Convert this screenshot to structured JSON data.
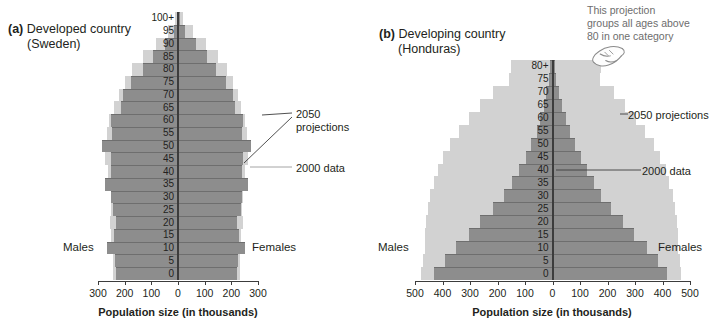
{
  "figure": {
    "x_axis_title": "Population size (in thousands)",
    "males_label": "Males",
    "females_label": "Females",
    "annotation_2050": "2050 projections",
    "annotation_2050_line1": "2050",
    "annotation_2050_line2": "projections",
    "annotation_2000": "2000 data",
    "callout": {
      "line1": "This projection",
      "line2": "groups all ages above",
      "line3": "80 in one category"
    },
    "colors": {
      "projection_2050": "#d2d2d2",
      "data_2000": "#8d8d8d",
      "axis": "#3c3c3c",
      "text": "#231f20",
      "callout_text": "#6d6d6d"
    }
  },
  "panel_a": {
    "tag": "(a)",
    "title_line1": "Developed country",
    "title_line2": "(Sweden)"
  },
  "panel_b": {
    "tag": "(b)",
    "title_line1": "Developing country",
    "title_line2": "(Honduras)"
  },
  "chart_data": [
    {
      "type": "bar",
      "subtype": "population-pyramid",
      "panel": "a",
      "title": "(a) Developed country (Sweden)",
      "xlabel": "Population size (in thousands)",
      "ylabel": "Age (years)",
      "xlim": [
        -300,
        300
      ],
      "xticks": [
        300,
        200,
        100,
        0,
        100,
        200,
        300
      ],
      "xtick_labels": [
        "300",
        "200",
        "100",
        "0",
        "100",
        "200",
        "300"
      ],
      "grid": false,
      "legend_position": "annotated-callouts",
      "age_groups": [
        "0",
        "5",
        "10",
        "15",
        "20",
        "25",
        "30",
        "35",
        "40",
        "45",
        "50",
        "55",
        "60",
        "65",
        "70",
        "75",
        "80",
        "85",
        "90",
        "95",
        "100+"
      ],
      "series": [
        {
          "name": "2050 projections",
          "color": "#d2d2d2",
          "males": [
            245,
            245,
            250,
            250,
            255,
            250,
            250,
            265,
            262,
            272,
            272,
            265,
            258,
            240,
            222,
            200,
            172,
            130,
            82,
            38,
            10
          ],
          "females": [
            232,
            232,
            238,
            238,
            242,
            240,
            242,
            255,
            252,
            262,
            262,
            258,
            252,
            238,
            225,
            208,
            185,
            150,
            105,
            58,
            18
          ]
        },
        {
          "name": "2000 data",
          "color": "#8d8d8d",
          "males": [
            232,
            235,
            265,
            240,
            232,
            245,
            252,
            275,
            250,
            252,
            285,
            248,
            252,
            215,
            208,
            175,
            130,
            92,
            48,
            15,
            3
          ],
          "females": [
            222,
            225,
            252,
            228,
            222,
            235,
            240,
            262,
            240,
            242,
            272,
            240,
            245,
            212,
            208,
            180,
            142,
            110,
            66,
            25,
            6
          ]
        }
      ]
    },
    {
      "type": "bar",
      "subtype": "population-pyramid",
      "panel": "b",
      "title": "(b) Developing country (Honduras)",
      "xlabel": "Population size (in thousands)",
      "ylabel": "Age (years)",
      "xlim": [
        -500,
        500
      ],
      "xticks": [
        500,
        400,
        300,
        200,
        100,
        0,
        100,
        200,
        300,
        400,
        500
      ],
      "xtick_labels": [
        "500",
        "400",
        "300",
        "200",
        "100",
        "0",
        "100",
        "200",
        "300",
        "400",
        "500"
      ],
      "grid": false,
      "legend_position": "annotated-callouts",
      "age_groups": [
        "0",
        "5",
        "10",
        "15",
        "20",
        "25",
        "30",
        "35",
        "40",
        "45",
        "50",
        "55",
        "60",
        "65",
        "70",
        "75",
        "80+"
      ],
      "series": [
        {
          "name": "2050 projections",
          "color": "#d2d2d2",
          "males": [
            480,
            472,
            465,
            462,
            460,
            452,
            445,
            432,
            418,
            398,
            372,
            340,
            305,
            262,
            215,
            160,
            152
          ],
          "females": [
            468,
            462,
            458,
            455,
            452,
            445,
            438,
            425,
            412,
            392,
            368,
            338,
            305,
            265,
            222,
            172,
            178
          ]
        },
        {
          "name": "2000 data",
          "color": "#8d8d8d",
          "males": [
            430,
            392,
            352,
            305,
            262,
            215,
            178,
            148,
            122,
            98,
            78,
            58,
            45,
            32,
            22,
            12,
            8
          ],
          "females": [
            418,
            382,
            342,
            298,
            258,
            212,
            178,
            150,
            125,
            102,
            82,
            62,
            48,
            35,
            24,
            14,
            10
          ]
        }
      ]
    }
  ]
}
